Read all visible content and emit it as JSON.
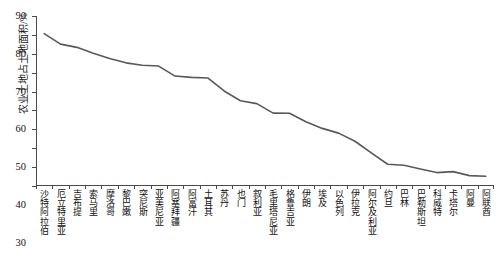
{
  "chart_data": {
    "type": "line",
    "title": "",
    "xlabel": "",
    "ylabel": "农业土地占土地面积/%",
    "ylim": [
      0,
      90
    ],
    "ytick_labels": [
      "0",
      "10",
      "20",
      "30",
      "40",
      "50",
      "60",
      "70",
      "80",
      "90"
    ],
    "ytick_values": [
      0,
      10,
      20,
      30,
      40,
      50,
      60,
      70,
      80,
      90
    ],
    "grid": false,
    "legend": "none",
    "line_color": "#595959",
    "categories": [
      "沙特阿拉伯",
      "厄立特里亚",
      "吉布提",
      "索马里",
      "摩洛哥",
      "黎巴嫩",
      "突尼斯",
      "亚美尼亚",
      "阿塞拜疆",
      "阿富汗",
      "土耳其",
      "苏丹",
      "也门",
      "叙利亚",
      "毛里塔尼亚",
      "格鲁吉亚",
      "伊朗",
      "埃及",
      "以色列",
      "伊拉克",
      "阿尔及利亚",
      "约旦",
      "巴林",
      "巴勒斯坦",
      "科威特",
      "卡塔尔",
      "阿曼",
      "阿联酋"
    ],
    "values": [
      80.7,
      75.1,
      73.4,
      70.3,
      67.5,
      65.2,
      63.9,
      63.5,
      58.2,
      57.5,
      57.2,
      50.3,
      45.1,
      43.6,
      38.6,
      38.5,
      34.0,
      30.5,
      28.0,
      23.7,
      17.5,
      11.5,
      11.0,
      9.0,
      7.1,
      7.6,
      5.5,
      5.2
    ]
  }
}
